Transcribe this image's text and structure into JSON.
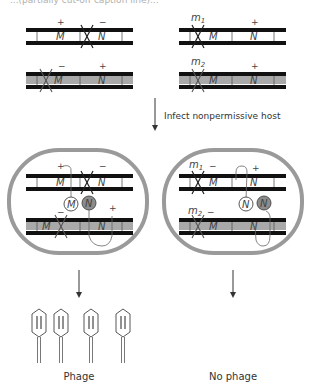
{
  "header_text": "...(partially cut-off caption line)...",
  "colors": {
    "strand": "#111111",
    "gray_fill": "#a9a9a9",
    "cell_border": "#9a9a9a",
    "protein_gray": "#8c8c8c",
    "text": "#333333"
  },
  "top_left": {
    "chromosome_1": {
      "fill": "white",
      "genes": [
        "M",
        "N"
      ],
      "signs": [
        "+",
        "−"
      ],
      "mutation_in": "N"
    },
    "chromosome_2": {
      "fill": "gray",
      "genes": [
        "M",
        "N"
      ],
      "signs": [
        "−",
        "+"
      ],
      "mutation_in": "M"
    }
  },
  "top_right": {
    "chromosome_1": {
      "fill": "white",
      "genes": [
        "M",
        "N"
      ],
      "labels": [
        "m1",
        "+"
      ],
      "mutation_label": "m",
      "mutation_sub": "1",
      "sign_N": "+"
    },
    "chromosome_2": {
      "fill": "gray",
      "genes": [
        "M",
        "N"
      ],
      "labels": [
        "m2",
        "+"
      ],
      "mutation_label": "m",
      "mutation_sub": "2",
      "sign_N": "+"
    }
  },
  "step_arrow_label": "Infect nonpermissive host",
  "cell_left": {
    "chromosome_1": {
      "genes": [
        "M",
        "N"
      ],
      "signs": [
        "+",
        "−"
      ]
    },
    "chromosome_2": {
      "genes": [
        "M",
        "N"
      ],
      "signs": [
        "−",
        "+"
      ]
    },
    "proteins": [
      {
        "label": "M",
        "fill": "white"
      },
      {
        "label": "N",
        "fill": "gray"
      }
    ]
  },
  "cell_right": {
    "chromosome_1": {
      "genes": [
        "M",
        "N"
      ],
      "labels": [
        "m",
        "1",
        "−",
        "+"
      ]
    },
    "chromosome_2": {
      "genes": [
        "M",
        "N"
      ],
      "labels": [
        "m",
        "2",
        "−"
      ]
    },
    "proteins": [
      {
        "label": "N",
        "fill": "white"
      },
      {
        "label": "N",
        "fill": "gray"
      }
    ]
  },
  "outcomes": {
    "left": {
      "label": "Phage",
      "phage_count": 4
    },
    "right": {
      "label": "No phage"
    }
  },
  "text": {
    "plus": "+",
    "minus": "−",
    "M": "M",
    "N": "N",
    "m": "m",
    "sub1": "1",
    "sub2": "2"
  }
}
